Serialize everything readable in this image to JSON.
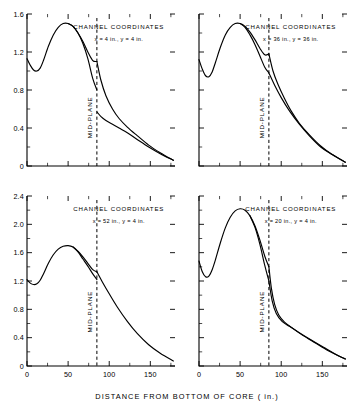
{
  "figure": {
    "xlabel": "DISTANCE FROM BOTTOM OF CORE ( in.)",
    "midplane_label": "MID-PLANE",
    "panel_title": "CHANNEL  COORDINATES"
  },
  "chart_data": [
    {
      "type": "line",
      "panel": "top-left",
      "title": "CHANNEL  COORDINATES",
      "annotation": "x = 4 in., y = 4 in.",
      "xlabel": "DISTANCE FROM BOTTOM OF CORE ( in.)",
      "ylabel": "",
      "xlim": [
        0,
        180
      ],
      "ylim": [
        0,
        1.6
      ],
      "xticks": [
        0,
        50,
        100,
        150
      ],
      "xticklabels": [
        "0",
        "50",
        "100",
        "150"
      ],
      "xticks_minor": [
        25,
        75,
        125,
        175
      ],
      "yticks": [
        0,
        0.4,
        0.8,
        1.2,
        1.6
      ],
      "yticklabels": [
        "0",
        "0.4",
        "0.8",
        "1.2",
        "1.6"
      ],
      "yticks_minor": [
        0.2,
        0.6,
        1.0,
        1.4
      ],
      "grid": false,
      "midplane_x": 85,
      "series": [
        {
          "name": "upper-branch",
          "x": [
            0,
            4,
            8,
            12,
            16,
            20,
            26,
            32,
            38,
            44,
            50,
            56,
            62,
            68,
            74,
            80,
            85
          ],
          "y": [
            1.13,
            1.06,
            1.01,
            1.0,
            1.03,
            1.11,
            1.26,
            1.38,
            1.46,
            1.5,
            1.5,
            1.47,
            1.4,
            1.31,
            1.2,
            1.11,
            1.1
          ]
        },
        {
          "name": "lower-branch-left",
          "x": [
            50,
            56,
            62,
            68,
            74,
            80,
            85
          ],
          "y": [
            1.5,
            1.47,
            1.4,
            1.29,
            1.13,
            0.92,
            0.8
          ]
        },
        {
          "name": "post-midplane-upper",
          "x": [
            85,
            90,
            96,
            104,
            112,
            122,
            134,
            148,
            162,
            178
          ],
          "y": [
            1.1,
            0.9,
            0.74,
            0.6,
            0.5,
            0.41,
            0.32,
            0.22,
            0.14,
            0.06
          ]
        },
        {
          "name": "post-midplane-lower",
          "x": [
            85,
            90,
            96,
            104,
            112,
            122,
            134,
            148,
            162,
            178
          ],
          "y": [
            0.57,
            0.52,
            0.48,
            0.44,
            0.4,
            0.35,
            0.28,
            0.2,
            0.13,
            0.06
          ]
        }
      ]
    },
    {
      "type": "line",
      "panel": "top-right",
      "title": "CHANNEL  COORDINATES",
      "annotation": "x = 36 in., y = 36 in.",
      "xlabel": "DISTANCE FROM BOTTOM OF CORE ( in.)",
      "ylabel": "",
      "xlim": [
        0,
        180
      ],
      "ylim": [
        0,
        1.6
      ],
      "xticks": [
        0,
        50,
        100,
        150
      ],
      "xticklabels": [
        "0",
        "50",
        "100",
        "150"
      ],
      "xticks_minor": [
        25,
        75,
        125,
        175
      ],
      "yticks": [
        0,
        0.4,
        0.8,
        1.2,
        1.6
      ],
      "yticklabels": [],
      "yticks_minor": [
        0.2,
        0.6,
        1.0,
        1.4
      ],
      "grid": false,
      "midplane_x": 85,
      "series": [
        {
          "name": "upper-branch",
          "x": [
            0,
            4,
            8,
            12,
            16,
            20,
            26,
            32,
            38,
            44,
            50,
            56,
            62,
            68,
            74,
            80,
            85
          ],
          "y": [
            1.12,
            1.02,
            0.95,
            0.94,
            0.99,
            1.09,
            1.25,
            1.38,
            1.46,
            1.5,
            1.5,
            1.47,
            1.41,
            1.33,
            1.24,
            1.17,
            1.18
          ]
        },
        {
          "name": "lower-branch-left",
          "x": [
            50,
            56,
            62,
            68,
            74,
            80,
            85
          ],
          "y": [
            1.5,
            1.46,
            1.38,
            1.28,
            1.16,
            1.04,
            0.98
          ]
        },
        {
          "name": "post-midplane-upper",
          "x": [
            85,
            90,
            96,
            104,
            112,
            122,
            134,
            148,
            162,
            178
          ],
          "y": [
            1.18,
            1.0,
            0.86,
            0.71,
            0.58,
            0.45,
            0.33,
            0.21,
            0.12,
            0.04
          ]
        },
        {
          "name": "post-midplane-lower",
          "x": [
            85,
            92,
            100,
            110,
            122,
            134,
            148,
            162,
            178
          ],
          "y": [
            0.98,
            0.85,
            0.72,
            0.58,
            0.44,
            0.32,
            0.2,
            0.12,
            0.04
          ]
        }
      ]
    },
    {
      "type": "line",
      "panel": "bottom-left",
      "title": "CHANNEL  COORDINATES",
      "annotation": "x = 52 in., y = 4 in.",
      "xlabel": "DISTANCE FROM BOTTOM OF CORE ( in.)",
      "ylabel": "",
      "xlim": [
        0,
        180
      ],
      "ylim": [
        0,
        2.4
      ],
      "xticks": [
        0,
        50,
        100,
        150
      ],
      "xticklabels": [
        "0",
        "50",
        "100",
        "150"
      ],
      "xticks_minor": [
        25,
        75,
        125,
        175
      ],
      "yticks": [
        0,
        0.4,
        0.8,
        1.2,
        1.6,
        2.0,
        2.4
      ],
      "yticklabels": [
        "0",
        "0.4",
        "0.8",
        "1.2",
        "1.6",
        "2.0",
        "2.4"
      ],
      "yticks_minor": [
        0.2,
        0.6,
        1.0,
        1.4,
        1.8,
        2.2
      ],
      "grid": false,
      "midplane_x": 85,
      "series": [
        {
          "name": "upper-branch",
          "x": [
            0,
            4,
            8,
            12,
            16,
            20,
            26,
            32,
            38,
            44,
            50,
            56,
            62,
            68,
            74,
            80,
            85
          ],
          "y": [
            1.22,
            1.17,
            1.15,
            1.16,
            1.21,
            1.3,
            1.45,
            1.57,
            1.65,
            1.69,
            1.7,
            1.68,
            1.62,
            1.54,
            1.45,
            1.36,
            1.33
          ]
        },
        {
          "name": "lower-branch-left",
          "x": [
            56,
            62,
            68,
            74,
            80,
            85
          ],
          "y": [
            1.68,
            1.61,
            1.51,
            1.41,
            1.3,
            1.22
          ]
        },
        {
          "name": "post-midplane",
          "x": [
            85,
            92,
            100,
            110,
            122,
            134,
            148,
            162,
            178
          ],
          "y": [
            1.33,
            1.18,
            1.02,
            0.83,
            0.63,
            0.46,
            0.3,
            0.18,
            0.07
          ]
        }
      ]
    },
    {
      "type": "line",
      "panel": "bottom-right",
      "title": "CHANNEL  COORDINATES",
      "annotation": "x = 20 in., y = 4 in.",
      "xlabel": "DISTANCE FROM BOTTOM OF CORE ( in.)",
      "ylabel": "",
      "xlim": [
        0,
        180
      ],
      "ylim": [
        0,
        2.4
      ],
      "xticks": [
        0,
        50,
        100,
        150
      ],
      "xticklabels": [
        "0",
        "50",
        "100",
        "150"
      ],
      "xticks_minor": [
        25,
        75,
        125,
        175
      ],
      "yticks": [
        0,
        0.4,
        0.8,
        1.2,
        1.6,
        2.0,
        2.4
      ],
      "yticklabels": [],
      "yticks_minor": [
        0.2,
        0.6,
        1.0,
        1.4,
        1.8,
        2.2
      ],
      "grid": false,
      "midplane_x": 85,
      "series": [
        {
          "name": "upper-branch",
          "x": [
            0,
            4,
            8,
            12,
            16,
            20,
            26,
            32,
            38,
            44,
            50,
            56,
            62,
            68,
            74,
            80,
            85
          ],
          "y": [
            1.48,
            1.33,
            1.26,
            1.27,
            1.36,
            1.5,
            1.74,
            1.95,
            2.1,
            2.19,
            2.22,
            2.2,
            2.12,
            1.98,
            1.78,
            1.55,
            1.4
          ]
        },
        {
          "name": "lower-branch-left",
          "x": [
            62,
            68,
            74,
            80,
            85
          ],
          "y": [
            2.12,
            1.96,
            1.72,
            1.42,
            1.2
          ]
        },
        {
          "name": "post-midplane-upper",
          "x": [
            85,
            88,
            92,
            97,
            104,
            113,
            124,
            138,
            155,
            172,
            178
          ],
          "y": [
            1.4,
            1.1,
            0.87,
            0.72,
            0.62,
            0.54,
            0.45,
            0.35,
            0.23,
            0.13,
            0.1
          ]
        },
        {
          "name": "post-midplane-lower",
          "x": [
            85,
            89,
            94,
            101,
            110,
            122,
            136,
            152,
            170,
            178
          ],
          "y": [
            1.2,
            0.92,
            0.74,
            0.63,
            0.56,
            0.47,
            0.37,
            0.26,
            0.14,
            0.1
          ]
        }
      ]
    }
  ]
}
